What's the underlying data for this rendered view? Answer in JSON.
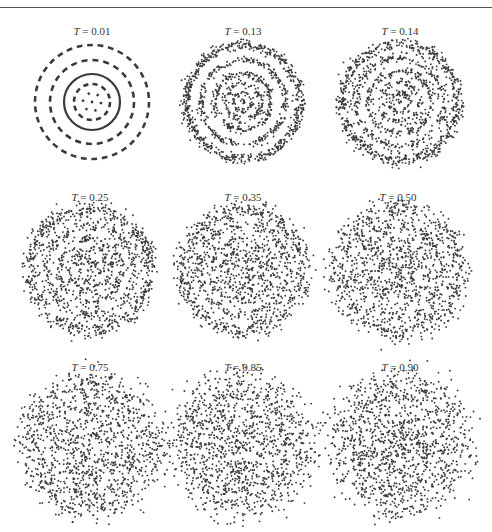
{
  "header": {
    "rule": true
  },
  "chart_data": {
    "type": "scatter",
    "title": "",
    "layout": {
      "rows": 3,
      "cols": 3,
      "grid": false,
      "axes": false,
      "legend": false
    },
    "label_prefix": "T",
    "point_color": "#3a3a3a",
    "panels": [
      {
        "label": "T = 0.01",
        "T": "0.01",
        "cx": 92,
        "cy": 102,
        "label_y": 32,
        "rings": [
          0,
          9,
          18,
          28,
          42,
          57
        ],
        "noise": 0.6,
        "style": "dashed",
        "points": 700
      },
      {
        "label": "T = 0.13",
        "T": "0.13",
        "cx": 243,
        "cy": 102,
        "label_y": 32,
        "rings": [
          0,
          9,
          18,
          28,
          42,
          57
        ],
        "noise": 1.8,
        "style": "scatter",
        "points": 1300
      },
      {
        "label": "T = 0.14",
        "T": "0.14",
        "cx": 400,
        "cy": 102,
        "label_y": 32,
        "rings": [
          0,
          10,
          20,
          31,
          44,
          58
        ],
        "noise": 2.2,
        "style": "scatter",
        "points": 1300
      },
      {
        "label": "T = 0.25",
        "T": "0.25",
        "cx": 90,
        "cy": 270,
        "label_y": 198,
        "rings": [
          0,
          10,
          20,
          31,
          44,
          60
        ],
        "noise": 3.0,
        "style": "scatter",
        "points": 1300
      },
      {
        "label": "T = 0.35",
        "T": "0.35",
        "cx": 243,
        "cy": 270,
        "label_y": 198,
        "rings": [
          0,
          10,
          20,
          31,
          44,
          60
        ],
        "noise": 3.4,
        "style": "scatter",
        "points": 1300
      },
      {
        "label": "T = 0.50",
        "T": "0.50",
        "cx": 398,
        "cy": 270,
        "label_y": 198,
        "rings": [
          0,
          10,
          20,
          31,
          44,
          61
        ],
        "noise": 4.2,
        "style": "scatter",
        "points": 1300
      },
      {
        "label": "T = 0.75",
        "T": "0.75",
        "cx": 90,
        "cy": 445,
        "label_y": 368,
        "rings": [
          0,
          10,
          21,
          32,
          46,
          62
        ],
        "noise": 5.2,
        "style": "scatter",
        "points": 1300
      },
      {
        "label": "T = 0.85",
        "T": "0.85",
        "cx": 243,
        "cy": 445,
        "label_y": 368,
        "rings": [
          0,
          10,
          21,
          32,
          46,
          62
        ],
        "noise": 5.8,
        "style": "scatter",
        "points": 1300
      },
      {
        "label": "T = 0.90",
        "T": "0.90",
        "cx": 400,
        "cy": 445,
        "label_y": 368,
        "rings": [
          0,
          10,
          21,
          32,
          46,
          62
        ],
        "noise": 6.8,
        "style": "scatter",
        "points": 1300
      }
    ]
  }
}
